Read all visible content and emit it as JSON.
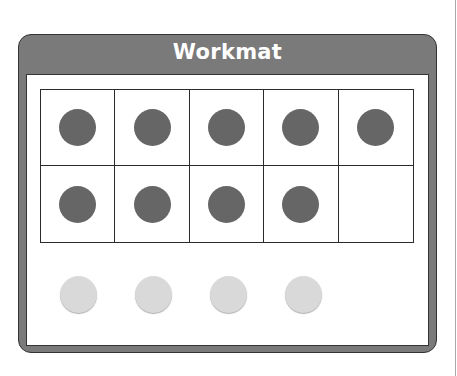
{
  "workmat": {
    "title": "Workmat",
    "header_color": "#7a7a7a",
    "ten_frame": {
      "rows": 2,
      "columns": 5,
      "cells": [
        {
          "filled": true
        },
        {
          "filled": true
        },
        {
          "filled": true
        },
        {
          "filled": true
        },
        {
          "filled": true
        },
        {
          "filled": true
        },
        {
          "filled": true
        },
        {
          "filled": true
        },
        {
          "filled": true
        },
        {
          "filled": false
        }
      ],
      "filled_count": 9,
      "counter_color": "#666666"
    },
    "loose_counters": {
      "count": 4,
      "color": "#d9d9d9"
    }
  }
}
